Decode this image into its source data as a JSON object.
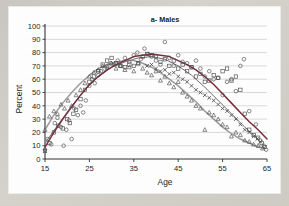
{
  "figure": {
    "title": "a- Males",
    "background_color": "#cccac3",
    "panel_color": "#ffffff"
  },
  "chart_data": {
    "type": "scatter",
    "title": "a- Males",
    "xlabel": "Age",
    "ylabel": "Percent",
    "xlim": [
      15,
      65
    ],
    "ylim": [
      0,
      100
    ],
    "xticks": [
      15,
      25,
      35,
      45,
      55,
      65
    ],
    "yticks": [
      0,
      10,
      20,
      30,
      40,
      50,
      60,
      70,
      80,
      90,
      100
    ],
    "grid": "horizontal",
    "legend": "none",
    "colors": {
      "curve_upper": "#7b2d3a",
      "curve_lower": "#9a9a9a",
      "curve_mid": "#8a8a8a",
      "marker": "#4a4a4a",
      "gridline": "#bfbfbf",
      "axis": "#333333"
    },
    "series": [
      {
        "name": "series-circle",
        "marker": "circle",
        "points": [
          [
            15,
            7
          ],
          [
            15.6,
            15
          ],
          [
            16.4,
            11
          ],
          [
            17.2,
            27
          ],
          [
            17.8,
            31
          ],
          [
            18.6,
            24
          ],
          [
            19.2,
            10
          ],
          [
            19.8,
            22
          ],
          [
            20.4,
            29
          ],
          [
            21,
            15
          ],
          [
            21.6,
            38
          ],
          [
            22.4,
            33
          ],
          [
            23,
            40
          ],
          [
            23.6,
            35
          ],
          [
            24.2,
            44
          ],
          [
            25,
            55
          ],
          [
            25.6,
            60
          ],
          [
            26.2,
            57
          ],
          [
            27,
            63
          ],
          [
            27.6,
            66
          ],
          [
            28.4,
            68
          ],
          [
            29,
            70
          ],
          [
            29.8,
            72
          ],
          [
            30.6,
            71
          ],
          [
            31.4,
            74
          ],
          [
            32,
            70
          ],
          [
            33,
            76
          ],
          [
            34,
            73
          ],
          [
            35,
            78
          ],
          [
            35.8,
            80
          ],
          [
            36.6,
            75
          ],
          [
            37.4,
            83
          ],
          [
            38.2,
            79
          ],
          [
            39,
            77
          ],
          [
            40,
            74
          ],
          [
            41,
            71
          ],
          [
            42,
            88
          ],
          [
            43,
            76
          ],
          [
            44,
            70
          ],
          [
            45,
            78
          ],
          [
            46,
            73
          ],
          [
            47,
            72
          ],
          [
            48,
            69
          ],
          [
            49,
            74
          ],
          [
            50,
            68
          ],
          [
            51,
            62
          ],
          [
            52,
            66
          ],
          [
            53,
            60
          ],
          [
            54,
            61
          ],
          [
            55,
            48
          ],
          [
            56,
            58
          ],
          [
            57,
            60
          ],
          [
            58,
            51
          ],
          [
            59,
            70
          ],
          [
            59.8,
            75
          ],
          [
            61,
            36
          ],
          [
            62.5,
            26
          ],
          [
            63.5,
            14
          ],
          [
            64.3,
            10
          ],
          [
            64.8,
            7
          ]
        ]
      },
      {
        "name": "series-square",
        "marker": "square",
        "points": [
          [
            15,
            6
          ],
          [
            16,
            12
          ],
          [
            17,
            20
          ],
          [
            18,
            25
          ],
          [
            19,
            23
          ],
          [
            20,
            30
          ],
          [
            20.6,
            27
          ],
          [
            21.4,
            34
          ],
          [
            22,
            37
          ],
          [
            23,
            45
          ],
          [
            24,
            52
          ],
          [
            25,
            58
          ],
          [
            26,
            62
          ],
          [
            27,
            66
          ],
          [
            28,
            71
          ],
          [
            29,
            74
          ],
          [
            30,
            76
          ],
          [
            31,
            72
          ],
          [
            32,
            70
          ],
          [
            33,
            69
          ],
          [
            34,
            71
          ],
          [
            35,
            70
          ],
          [
            36,
            72
          ],
          [
            37,
            77
          ],
          [
            38,
            79
          ],
          [
            39,
            78
          ],
          [
            40,
            77
          ],
          [
            41,
            73
          ],
          [
            42,
            75
          ],
          [
            43,
            70
          ],
          [
            44,
            74
          ],
          [
            45,
            68
          ],
          [
            46,
            71
          ],
          [
            47,
            66
          ],
          [
            48,
            69
          ],
          [
            49,
            62
          ],
          [
            50,
            64
          ],
          [
            51,
            58
          ],
          [
            52,
            59
          ],
          [
            53,
            63
          ],
          [
            54,
            61
          ],
          [
            55,
            66
          ],
          [
            56,
            68
          ],
          [
            57,
            59
          ],
          [
            58,
            62
          ],
          [
            59,
            52
          ],
          [
            60,
            34
          ],
          [
            61,
            22
          ],
          [
            62,
            18
          ],
          [
            63,
            16
          ],
          [
            63.8,
            12
          ],
          [
            64.5,
            9
          ]
        ]
      },
      {
        "name": "series-triangle",
        "marker": "triangle",
        "points": [
          [
            15,
            22
          ],
          [
            16,
            32
          ],
          [
            17,
            36
          ],
          [
            17.8,
            34
          ],
          [
            18.6,
            41
          ],
          [
            19.4,
            38
          ],
          [
            20.2,
            44
          ],
          [
            21,
            40
          ],
          [
            22,
            48
          ],
          [
            23,
            52
          ],
          [
            24,
            57
          ],
          [
            25,
            62
          ],
          [
            26,
            65
          ],
          [
            27,
            67
          ],
          [
            28,
            70
          ],
          [
            29,
            69
          ],
          [
            30,
            72
          ],
          [
            31,
            68
          ],
          [
            32,
            70
          ],
          [
            33,
            67
          ],
          [
            34,
            69
          ],
          [
            35,
            66
          ],
          [
            36,
            72
          ],
          [
            37,
            68
          ],
          [
            38,
            65
          ],
          [
            39,
            63
          ],
          [
            40,
            66
          ],
          [
            41,
            59
          ],
          [
            42,
            62
          ],
          [
            43,
            57
          ],
          [
            44,
            54
          ],
          [
            45,
            58
          ],
          [
            46,
            50
          ],
          [
            47,
            47
          ],
          [
            48,
            44
          ],
          [
            49,
            40
          ],
          [
            50,
            38
          ],
          [
            51,
            22
          ],
          [
            52,
            35
          ],
          [
            53,
            33
          ],
          [
            54,
            30
          ],
          [
            55,
            26
          ],
          [
            56,
            24
          ],
          [
            57,
            17
          ],
          [
            58,
            20
          ],
          [
            59,
            18
          ],
          [
            60,
            14
          ],
          [
            61,
            13
          ],
          [
            62,
            11
          ],
          [
            63,
            10
          ],
          [
            64,
            8
          ]
        ]
      },
      {
        "name": "series-cross",
        "marker": "x",
        "points": [
          [
            38,
            70
          ],
          [
            39,
            71
          ],
          [
            40,
            68
          ],
          [
            41,
            66
          ],
          [
            42,
            67
          ],
          [
            43,
            64
          ],
          [
            44,
            65
          ],
          [
            45,
            62
          ],
          [
            46,
            60
          ],
          [
            47,
            58
          ],
          [
            48,
            55
          ],
          [
            49,
            52
          ],
          [
            50,
            50
          ],
          [
            51,
            48
          ],
          [
            52,
            46
          ],
          [
            53,
            44
          ],
          [
            54,
            41
          ],
          [
            55,
            38
          ],
          [
            56,
            36
          ],
          [
            57,
            33
          ],
          [
            58,
            30
          ],
          [
            59,
            26
          ],
          [
            60,
            22
          ],
          [
            61,
            20
          ],
          [
            62,
            17
          ],
          [
            62.8,
            15
          ],
          [
            63.5,
            13
          ]
        ]
      }
    ],
    "fitted_curves": [
      {
        "name": "upper-fit",
        "color": "#7b2d3a",
        "description": "quadratic fit peaking near age 39 at ~79 percent",
        "points": [
          [
            15,
            9
          ],
          [
            17,
            20
          ],
          [
            19,
            30
          ],
          [
            21,
            39
          ],
          [
            23,
            48
          ],
          [
            25,
            56
          ],
          [
            27,
            62
          ],
          [
            29,
            67
          ],
          [
            31,
            71
          ],
          [
            33,
            74
          ],
          [
            35,
            77
          ],
          [
            37,
            78
          ],
          [
            39,
            79
          ],
          [
            41,
            78
          ],
          [
            43,
            77
          ],
          [
            45,
            74
          ],
          [
            47,
            71
          ],
          [
            49,
            67
          ],
          [
            51,
            62
          ],
          [
            53,
            56
          ],
          [
            55,
            49
          ],
          [
            57,
            42
          ],
          [
            59,
            35
          ],
          [
            61,
            28
          ],
          [
            63,
            22
          ],
          [
            65,
            15
          ]
        ]
      },
      {
        "name": "lower-fit",
        "color": "#9c9c9c",
        "description": "quadratic fit peaking near age 34 at ~74 percent then declining steeply",
        "points": [
          [
            15,
            22
          ],
          [
            17,
            33
          ],
          [
            19,
            42
          ],
          [
            21,
            50
          ],
          [
            23,
            57
          ],
          [
            25,
            63
          ],
          [
            27,
            68
          ],
          [
            29,
            71
          ],
          [
            31,
            73
          ],
          [
            33,
            74
          ],
          [
            35,
            74
          ],
          [
            37,
            72
          ],
          [
            39,
            69
          ],
          [
            41,
            65
          ],
          [
            43,
            60
          ],
          [
            45,
            55
          ],
          [
            47,
            49
          ],
          [
            49,
            43
          ],
          [
            51,
            36
          ],
          [
            53,
            30
          ],
          [
            55,
            24
          ],
          [
            57,
            19
          ],
          [
            59,
            15
          ],
          [
            61,
            12
          ],
          [
            63,
            9
          ],
          [
            64.5,
            8
          ]
        ]
      },
      {
        "name": "mid-fit",
        "color": "#6e6e6e",
        "description": "fit overlapping the marker cloud between ages 15 and 45",
        "points": [
          [
            15,
            12
          ],
          [
            18,
            26
          ],
          [
            21,
            40
          ],
          [
            24,
            52
          ],
          [
            27,
            62
          ],
          [
            30,
            69
          ],
          [
            33,
            73
          ],
          [
            36,
            76
          ],
          [
            39,
            77
          ],
          [
            42,
            75
          ],
          [
            45,
            70
          ],
          [
            48,
            63
          ],
          [
            51,
            54
          ],
          [
            54,
            44
          ],
          [
            57,
            34
          ],
          [
            60,
            24
          ],
          [
            63,
            15
          ]
        ]
      }
    ]
  }
}
